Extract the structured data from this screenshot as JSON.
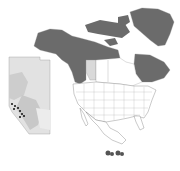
{
  "map": {
    "title": "",
    "type": "species distribution map",
    "regions": {
      "range_fill": "#6b6b6b",
      "alberta_fill": "#d9d9d9",
      "other_fill": "#ffffff",
      "border_color": "#8a8a8a"
    },
    "inset": {
      "name": "Alberta",
      "fill_light": "#e2e2e2",
      "fill_mid": "#c8c8c8",
      "point_color": "#111111",
      "points": [
        [
          18,
          102
        ],
        [
          21,
          105
        ],
        [
          16,
          107
        ],
        [
          23,
          108
        ],
        [
          19,
          111
        ],
        [
          24,
          113
        ],
        [
          21,
          116
        ],
        [
          26,
          118
        ]
      ]
    },
    "range_regions": [
      "Alaska",
      "Yukon",
      "Northwest Territories",
      "Nunavut",
      "British Columbia",
      "Quebec/Labrador",
      "Greenland",
      "Arctic Islands"
    ]
  }
}
